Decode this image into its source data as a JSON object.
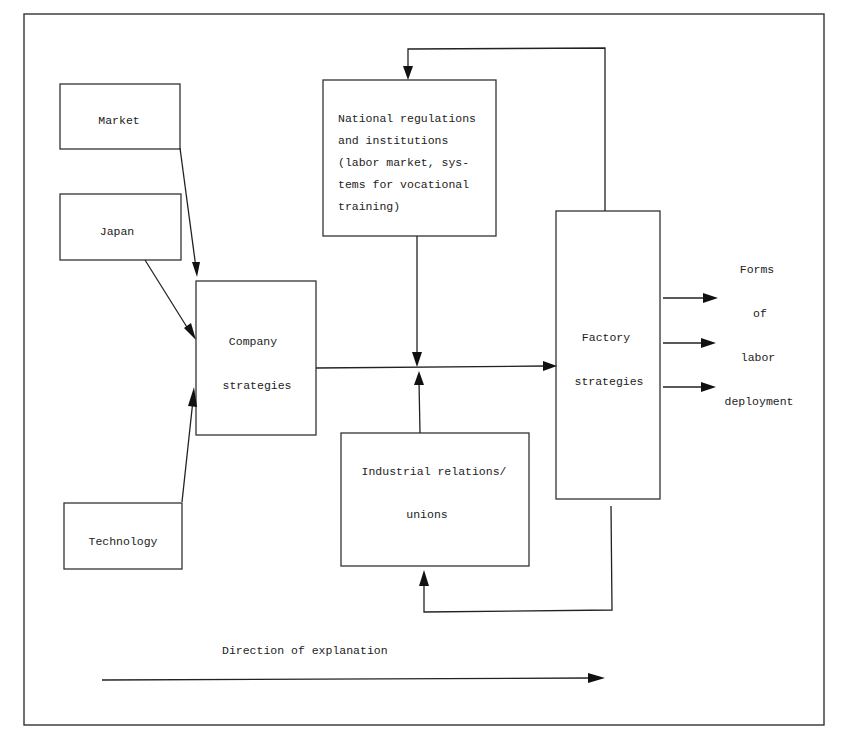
{
  "diagram": {
    "nodes": {
      "market": {
        "label": "Market"
      },
      "japan": {
        "label": "Japan"
      },
      "technology": {
        "label": "Technology"
      },
      "company": {
        "lines": [
          "Company",
          "strategies"
        ]
      },
      "national": {
        "lines": [
          "National regulations",
          "and institutions",
          "(labor market, sys-",
          "tems for vocational",
          "training)"
        ]
      },
      "industrial": {
        "lines": [
          "Industrial relations/",
          "unions"
        ]
      },
      "factory": {
        "lines": [
          "Factory",
          "strategies"
        ]
      },
      "forms": {
        "lines": [
          "Forms",
          "of",
          "labor",
          "deployment"
        ]
      }
    },
    "direction_label": "Direction of explanation",
    "edges": [
      "Market -> Company strategies",
      "Japan -> Company strategies",
      "Technology -> Company strategies",
      "Company strategies -> Factory strategies",
      "National regulations and institutions -> Company-Factory link",
      "Industrial relations/unions -> Company-Factory link",
      "Factory strategies -> National regulations and institutions (feedback)",
      "Factory strategies -> Industrial relations/unions (feedback)",
      "Factory strategies -> Forms of labor deployment (x3)"
    ]
  }
}
